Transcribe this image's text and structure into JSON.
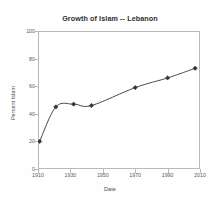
{
  "chart_data": {
    "type": "line",
    "title": "Growth of Islam -- Lebanon",
    "xlabel": "Date",
    "ylabel": "Percent Islam",
    "xlim": [
      1910,
      2010
    ],
    "ylim": [
      0,
      100
    ],
    "xticks": [
      1910,
      1930,
      1950,
      1970,
      1990,
      2010
    ],
    "yticks": [
      0,
      20,
      40,
      60,
      80,
      100
    ],
    "xtick_labels": [
      "1910",
      "1930",
      "1950",
      "1970",
      "1990",
      "2010"
    ],
    "ytick_labels": [
      "0",
      "20",
      "40",
      "60",
      "80",
      "100"
    ],
    "grid": false,
    "legend": "none",
    "series": [
      {
        "name": "Percent Islam",
        "color": "#333333",
        "marker": "diamond",
        "x": [
          1911,
          1921,
          1932,
          1943,
          1970,
          1990,
          2007
        ],
        "y": [
          20,
          45,
          47,
          46,
          59,
          66,
          73
        ]
      }
    ]
  }
}
